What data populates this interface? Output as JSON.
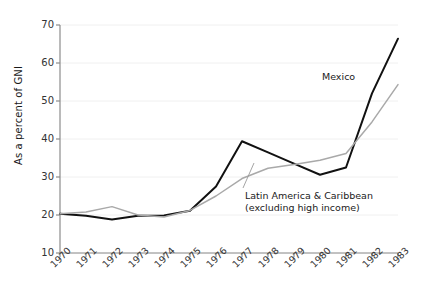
{
  "chart_data": {
    "type": "line",
    "title": "",
    "xlabel": "",
    "ylabel": "As a percent of GNI",
    "x": [
      1970,
      1971,
      1972,
      1973,
      1974,
      1975,
      1976,
      1977,
      1978,
      1979,
      1980,
      1981,
      1982,
      1983
    ],
    "xtick_labels": [
      "1970",
      "1971",
      "1972",
      "1973",
      "1974",
      "1975",
      "1976",
      "1977",
      "1978",
      "1979",
      "1980",
      "1981",
      "1982",
      "1983"
    ],
    "ytick_labels": [
      "10",
      "20",
      "30",
      "40",
      "50",
      "60",
      "70"
    ],
    "yticks": [
      10,
      20,
      30,
      40,
      50,
      60,
      70
    ],
    "ylim": [
      10,
      70
    ],
    "xlim": [
      1970,
      1983
    ],
    "grid": true,
    "legend_position": "inline-annotation",
    "series": [
      {
        "name": "Mexico",
        "color": "#111111",
        "values": [
          20.3,
          19.8,
          18.8,
          19.8,
          19.9,
          21.1,
          27.5,
          39.4,
          36.5,
          33.5,
          30.6,
          32.5,
          52.0,
          66.4
        ]
      },
      {
        "name": "Latin America & Caribbean (excluding high income)",
        "color": "#a9a9a9",
        "values": [
          20.3,
          20.8,
          22.2,
          20.0,
          19.5,
          21.2,
          25.0,
          29.6,
          32.3,
          33.3,
          34.4,
          36.2,
          44.5,
          54.3
        ]
      }
    ],
    "annotations": [
      {
        "id": "mexico",
        "text": "Mexico"
      },
      {
        "id": "lac_line1",
        "text": "Latin America & Caribbean"
      },
      {
        "id": "lac_line2",
        "text": "(excluding high income)"
      }
    ]
  },
  "axis": {
    "y_title": "As a percent of GNI"
  },
  "colors": {
    "mexico": "#111111",
    "lac": "#a9a9a9",
    "axis": "#8c8c8c",
    "grid": "#f0f0f0",
    "text": "#333333"
  }
}
